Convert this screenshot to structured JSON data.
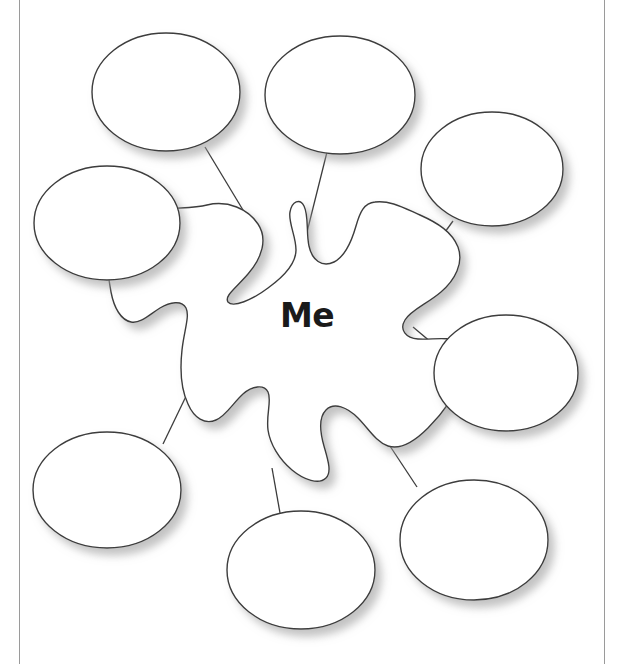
{
  "document": {
    "type": "graphic-organizer-worksheet",
    "center_label": "Me",
    "title": "Me",
    "bubble_count": 8,
    "bubble_text": "",
    "colors": {
      "background": "#ffffff",
      "stroke": "#3c3c3c",
      "text": "#1a1a1a",
      "rule_line": "#9a9a9a",
      "shadow": "#bdbdbd"
    }
  },
  "center_shape": {
    "name": "splat",
    "label": "Me",
    "label_x": 307,
    "label_y": 325
  },
  "bubbles": [
    {
      "id": "bubble-top-left",
      "label": "",
      "cx": 166,
      "cy": 92,
      "rx": 74,
      "ry": 59
    },
    {
      "id": "bubble-top-right",
      "label": "",
      "cx": 340,
      "cy": 95,
      "rx": 75,
      "ry": 59
    },
    {
      "id": "bubble-right-upper",
      "label": "",
      "cx": 492,
      "cy": 169,
      "rx": 71,
      "ry": 57
    },
    {
      "id": "bubble-right-middle",
      "label": "",
      "cx": 506,
      "cy": 373,
      "rx": 72,
      "ry": 58
    },
    {
      "id": "bubble-bottom-right",
      "label": "",
      "cx": 474,
      "cy": 540,
      "rx": 74,
      "ry": 60
    },
    {
      "id": "bubble-bottom-center",
      "label": "",
      "cx": 301,
      "cy": 570,
      "rx": 74,
      "ry": 59
    },
    {
      "id": "bubble-bottom-left",
      "label": "",
      "cx": 107,
      "cy": 490,
      "rx": 74,
      "ry": 58
    },
    {
      "id": "bubble-left-middle",
      "label": "",
      "cx": 107,
      "cy": 223,
      "rx": 73,
      "ry": 57
    }
  ],
  "connectors": [
    {
      "id": "connector-top-left",
      "x1": 205,
      "y1": 147,
      "x2": 246,
      "y2": 215
    },
    {
      "id": "connector-top-right",
      "x1": 327,
      "y1": 152,
      "x2": 298,
      "y2": 268
    },
    {
      "id": "connector-right-upper",
      "x1": 453,
      "y1": 221,
      "x2": 437,
      "y2": 243
    },
    {
      "id": "connector-right-middle",
      "x1": 438,
      "y1": 348,
      "x2": 413,
      "y2": 327
    },
    {
      "id": "connector-bottom-right",
      "x1": 417,
      "y1": 487,
      "x2": 386,
      "y2": 440
    },
    {
      "id": "connector-bottom-center",
      "x1": 280,
      "y1": 513,
      "x2": 272,
      "y2": 468
    },
    {
      "id": "connector-bottom-left",
      "x1": 163,
      "y1": 444,
      "x2": 190,
      "y2": 388
    },
    {
      "id": "connector-left-middle",
      "x1": 160,
      "y1": 268,
      "x2": 175,
      "y2": 288
    }
  ]
}
